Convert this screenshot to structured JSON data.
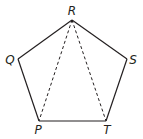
{
  "diagram": {
    "type": "regular-pentagon-with-diagonals",
    "vertices": [
      {
        "id": "R",
        "label": "R",
        "x": 72,
        "y": 20,
        "lx": 72,
        "ly": 15
      },
      {
        "id": "S",
        "label": "S",
        "x": 127,
        "y": 59,
        "lx": 133,
        "ly": 64
      },
      {
        "id": "T",
        "label": "T",
        "x": 106,
        "y": 121,
        "lx": 107,
        "ly": 134
      },
      {
        "id": "P",
        "label": "P",
        "x": 39,
        "y": 121,
        "lx": 38,
        "ly": 134
      },
      {
        "id": "Q",
        "label": "Q",
        "x": 18,
        "y": 59,
        "lx": 10,
        "ly": 64
      }
    ],
    "edges": [
      [
        "R",
        "S"
      ],
      [
        "S",
        "T"
      ],
      [
        "T",
        "P"
      ],
      [
        "P",
        "Q"
      ],
      [
        "Q",
        "R"
      ]
    ],
    "dashed_diagonals": [
      [
        "R",
        "P"
      ],
      [
        "R",
        "T"
      ]
    ],
    "colors": {
      "stroke": "#231f20",
      "background": "#ffffff"
    }
  }
}
